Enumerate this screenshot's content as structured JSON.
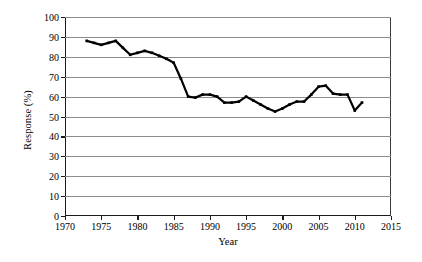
{
  "chart_data": {
    "type": "line",
    "title": "",
    "xlabel": "Year",
    "ylabel": "Response (%)",
    "xlim": [
      1970,
      2015
    ],
    "ylim": [
      0,
      100
    ],
    "xticks": [
      1970,
      1975,
      1980,
      1985,
      1990,
      1995,
      2000,
      2005,
      2010,
      2015
    ],
    "yticks": [
      0,
      10,
      20,
      30,
      40,
      50,
      60,
      70,
      80,
      90,
      100
    ],
    "grid": "horizontal",
    "legend": "none",
    "line_color": "#000000",
    "marker": "small-square",
    "x": [
      1973,
      1974,
      1975,
      1976,
      1977,
      1978,
      1979,
      1980,
      1981,
      1982,
      1983,
      1984,
      1985,
      1986,
      1987,
      1988,
      1989,
      1990,
      1991,
      1992,
      1993,
      1994,
      1995,
      1996,
      1997,
      1998,
      1999,
      2000,
      2001,
      2002,
      2003,
      2004,
      2005,
      2006,
      2007,
      2008,
      2009,
      2010,
      2011
    ],
    "values": [
      88,
      87,
      86,
      87,
      88,
      84.5,
      81,
      82,
      83,
      82,
      80.5,
      79,
      77,
      69,
      60,
      59.5,
      61,
      61,
      60,
      57,
      57,
      57.5,
      60,
      58,
      56,
      54,
      52.5,
      54,
      56,
      57.5,
      57.5,
      61,
      65,
      65.5,
      61.5,
      61,
      61,
      53,
      57
    ],
    "series": [
      {
        "name": "Response rate",
        "values": [
          88,
          87,
          86,
          87,
          88,
          84.5,
          81,
          82,
          83,
          82,
          80.5,
          79,
          77,
          69,
          60,
          59.5,
          61,
          61,
          60,
          57,
          57,
          57.5,
          60,
          58,
          56,
          54,
          52.5,
          54,
          56,
          57.5,
          57.5,
          61,
          65,
          65.5,
          61.5,
          61,
          61,
          53,
          57
        ]
      }
    ]
  }
}
